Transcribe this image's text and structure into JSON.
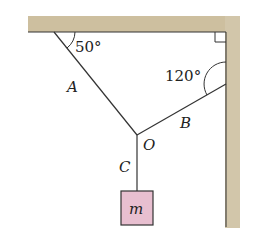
{
  "diagram": {
    "type": "statics-cable-tension",
    "labels": {
      "angle_ceiling": "50°",
      "angle_wall": "120°",
      "cable_a": "A",
      "cable_b": "B",
      "cable_c": "C",
      "junction": "O",
      "mass": "m"
    },
    "colors": {
      "surface_fill": "#c9b99a",
      "surface_edge": "#a8987a",
      "mass_fill": "#e8bfd0",
      "line": "#333333"
    }
  }
}
